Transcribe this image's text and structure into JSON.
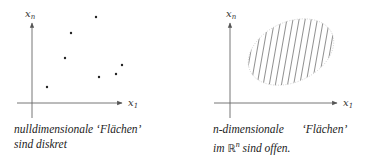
{
  "left_panel": {
    "axis_labels": {
      "y": "x",
      "y_sub": "n",
      "x": "x",
      "x_sub": "1"
    },
    "points": [
      [
        96,
        17
      ],
      [
        71,
        33
      ],
      [
        65,
        58
      ],
      [
        122,
        65
      ],
      [
        116,
        74
      ],
      [
        99,
        77
      ],
      [
        47,
        87
      ]
    ],
    "caption_line1_a": "nulldimensionale",
    "caption_line1_b": "‘Flächen’",
    "caption_line2": "sind diskret"
  },
  "right_panel": {
    "axis_labels": {
      "y": "x",
      "y_sub": "n",
      "x": "x",
      "x_sub": "1"
    },
    "region": {
      "shape": "ellipse",
      "fill": "hatched",
      "cx": 291,
      "cy": 52,
      "rx": 45,
      "ry": 30,
      "rotation_deg": -25
    },
    "caption_line1_a": "n",
    "caption_line1_b": "-dimensionale",
    "caption_line1_c": "‘Flächen’",
    "caption_line2_a": "im ",
    "caption_line2_R": "ℝ",
    "caption_line2_sup": "n",
    "caption_line2_b": " sind offen."
  }
}
